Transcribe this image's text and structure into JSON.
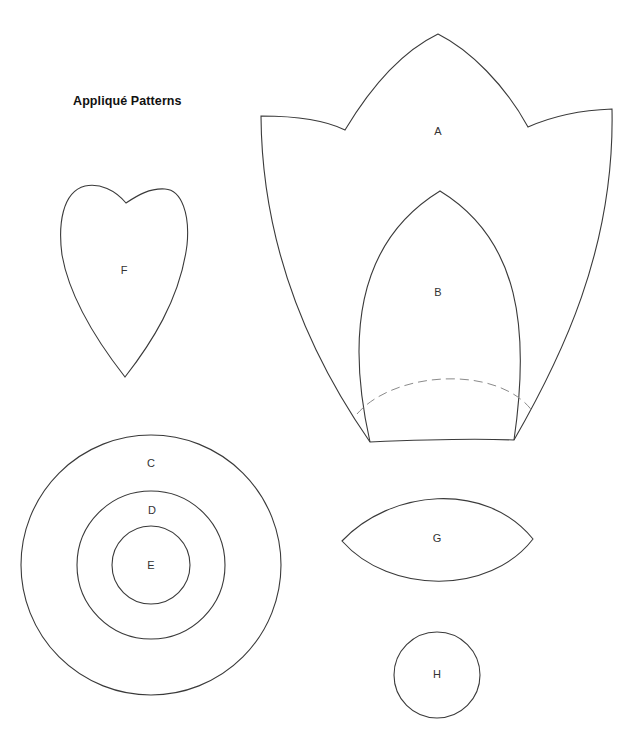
{
  "title": "Appliqué Patterns",
  "pieces": {
    "A": {
      "label": "A",
      "x": 438,
      "y": 131
    },
    "B": {
      "label": "B",
      "x": 438,
      "y": 292
    },
    "C": {
      "label": "C",
      "x": 151,
      "y": 463
    },
    "D": {
      "label": "D",
      "x": 152,
      "y": 510
    },
    "E": {
      "label": "E",
      "x": 151,
      "y": 565
    },
    "F": {
      "label": "F",
      "x": 124,
      "y": 270
    },
    "G": {
      "label": "G",
      "x": 437,
      "y": 538
    },
    "H": {
      "label": "H",
      "x": 437,
      "y": 674
    }
  },
  "colors": {
    "line": "#3a3a3a",
    "dashed_line": "#8a8a8a",
    "background": "#ffffff"
  }
}
